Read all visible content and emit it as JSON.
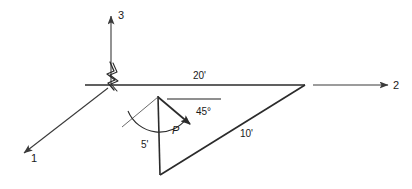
{
  "figure": {
    "type": "engineering-statics-free-body-diagram",
    "stroke_color": "#2b2b2b",
    "axis_color": "#4a4a4a",
    "background": "#ffffff"
  },
  "axes": [
    {
      "name": "axis-1",
      "label": "1",
      "direction": "down-left"
    },
    {
      "name": "axis-2",
      "label": "2",
      "direction": "right"
    },
    {
      "name": "axis-3",
      "label": "3",
      "direction": "up"
    }
  ],
  "dimensions": [
    {
      "name": "span-horizontal",
      "label": "20'"
    },
    {
      "name": "drop-vertical",
      "label": "5'"
    },
    {
      "name": "diagonal-member",
      "label": "10'"
    }
  ],
  "angle": {
    "label": "45°"
  },
  "force": {
    "label": "P"
  },
  "support": {
    "label": "break-symbol"
  }
}
